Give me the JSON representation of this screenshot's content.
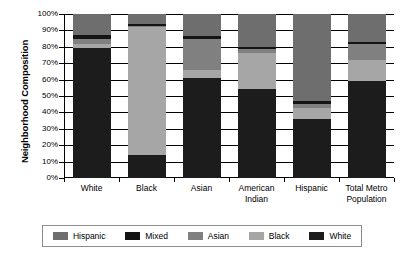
{
  "chart_data": {
    "type": "bar",
    "title": "",
    "xlabel": "",
    "ylabel": "Neighborhood Composition",
    "ylim": [
      0,
      100
    ],
    "grid": true,
    "stacked": true,
    "legend_position": "bottom",
    "categories": [
      "White",
      "Black",
      "Asian",
      "American Indian",
      "Hispanic",
      "Total Metro Population"
    ],
    "category_labels": [
      [
        "White"
      ],
      [
        "Black"
      ],
      [
        "Asian"
      ],
      [
        "American",
        "Indian"
      ],
      [
        "Hispanic"
      ],
      [
        "Total Metro",
        "Population"
      ]
    ],
    "ytick_labels": [
      "100%",
      "90%",
      "80%",
      "70%",
      "60%",
      "50%",
      "40%",
      "30%",
      "20%",
      "10%",
      "0%"
    ],
    "ytick_values": [
      100,
      90,
      80,
      70,
      60,
      50,
      40,
      30,
      20,
      10,
      0
    ],
    "series": [
      {
        "name": "White",
        "color": "#1c1c1c",
        "values": [
          79,
          14,
          61,
          54,
          36,
          59
        ]
      },
      {
        "name": "Black",
        "color": "#a6a6a6",
        "values": [
          3,
          78,
          5,
          22,
          7,
          13
        ]
      },
      {
        "name": "Asian",
        "color": "#808080",
        "values": [
          3,
          0.5,
          19,
          2.5,
          2,
          10
        ]
      },
      {
        "name": "Mixed",
        "color": "#141414",
        "values": [
          2,
          1.5,
          1.5,
          1.5,
          2,
          1
        ]
      },
      {
        "name": "Hispanic",
        "color": "#6e6e6e",
        "values": [
          13,
          6,
          13.5,
          20,
          53,
          17
        ]
      }
    ],
    "stack_order_bottom_to_top": [
      "White",
      "Black",
      "Asian",
      "Mixed",
      "Hispanic"
    ],
    "legend_entries": [
      {
        "label": "Hispanic",
        "color": "#6e6e6e"
      },
      {
        "label": "Mixed",
        "color": "#141414"
      },
      {
        "label": "Asian",
        "color": "#808080"
      },
      {
        "label": "Black",
        "color": "#a6a6a6"
      },
      {
        "label": "White",
        "color": "#1c1c1c"
      }
    ]
  }
}
